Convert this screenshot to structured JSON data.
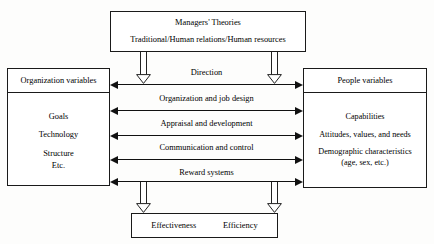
{
  "diagram": {
    "title_box": {
      "line1": "Managers' Theories",
      "line2": "Traditional/Human relations/Human resources"
    },
    "left_box": {
      "header": "Organization variables",
      "items": [
        "Goals",
        "Technology",
        "Structure",
        "Etc."
      ]
    },
    "right_box": {
      "header": "People variables",
      "items": [
        "Capabilities",
        "Attitudes, values, and needs",
        "Demographic characteristics",
        "(age, sex, etc.)"
      ]
    },
    "bottom_box": {
      "left_label": "Effectiveness",
      "right_label": "Efficiency"
    },
    "connections": [
      {
        "label": "Direction"
      },
      {
        "label": "Organization and job design"
      },
      {
        "label": "Appraisal and development"
      },
      {
        "label": "Communication and control"
      },
      {
        "label": "Reward systems"
      }
    ],
    "flow_arrows": [
      {
        "name": "theories-to-direction-left"
      },
      {
        "name": "theories-to-direction-right"
      },
      {
        "name": "rewards-to-outcomes-left"
      },
      {
        "name": "rewards-to-outcomes-right"
      }
    ],
    "colors": {
      "stroke": "#1a1a1a",
      "background": "#fdfdfc",
      "box_fill": "#ffffff"
    }
  }
}
